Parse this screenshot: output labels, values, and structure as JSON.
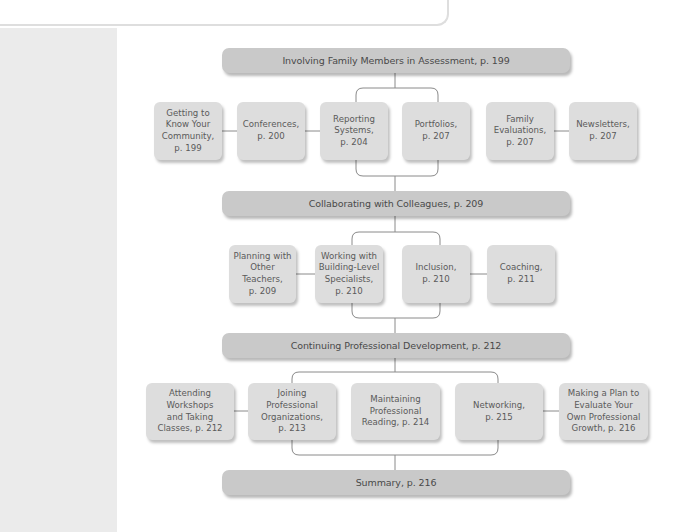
{
  "diagram": {
    "sections": [
      {
        "title": "Involving Family Members in Assessment, p. 199",
        "items": [
          "Getting to\nKnow Your\nCommunity,\np. 199",
          "Conferences,\np. 200",
          "Reporting\nSystems,\np. 204",
          "Portfolios,\np. 207",
          "Family\nEvaluations,\np. 207",
          "Newsletters,\np. 207"
        ]
      },
      {
        "title": "Collaborating with Colleagues, p. 209",
        "items": [
          "Planning with\nOther\nTeachers,\np. 209",
          "Working with\nBuilding-Level\nSpecialists,\np. 210",
          "Inclusion,\np. 210",
          "Coaching,\np. 211"
        ]
      },
      {
        "title": "Continuing Professional Development, p. 212",
        "items": [
          "Attending\nWorkshops\nand Taking\nClasses, p. 212",
          "Joining\nProfessional\nOrganizations,\np. 213",
          "Maintaining\nProfessional\nReading, p. 214",
          "Networking,\np. 215",
          "Making a Plan to\nEvaluate Your\nOwn Professional\nGrowth, p. 216"
        ]
      },
      {
        "title": "Summary, p. 216",
        "items": []
      }
    ],
    "colors": {
      "header_fill": "#c9c9c9",
      "node_fill": "#dddddd",
      "connector": "#8a8a8a",
      "side_strip": "#ebebeb"
    }
  }
}
